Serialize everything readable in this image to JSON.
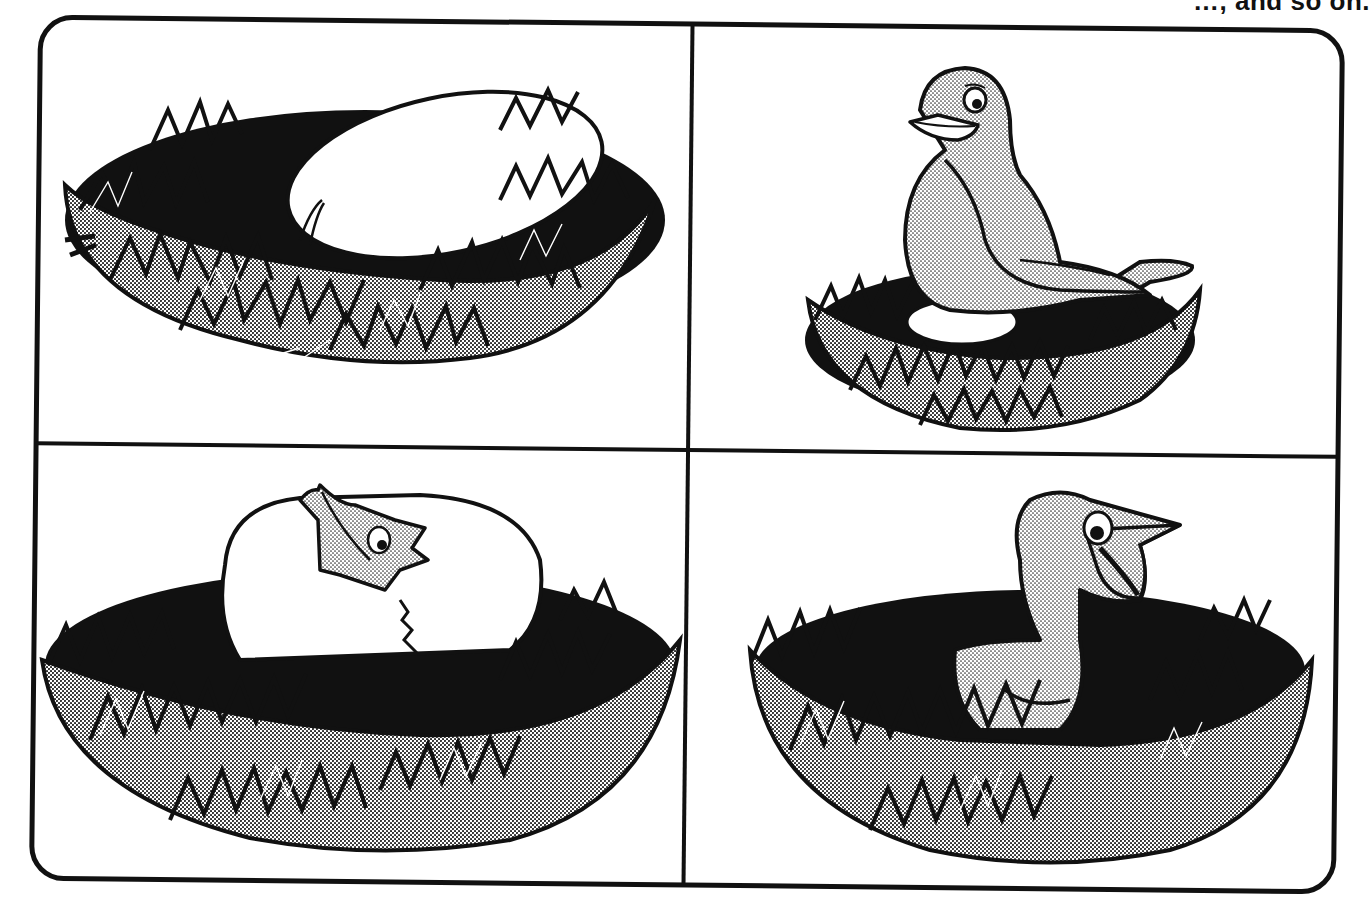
{
  "page": {
    "top_caption_fragment": "…, and so on.",
    "background": "#ffffff",
    "ink": "#111111",
    "shade": "#a8a8a8"
  },
  "panels": [
    {
      "id": "panel-1",
      "position": "top-left",
      "subject": "egg in nest",
      "description": "A single white egg resting in a grassy nest"
    },
    {
      "id": "panel-2",
      "position": "top-right",
      "subject": "bird sitting on nest",
      "description": "A mother bird sitting on the egg in the nest"
    },
    {
      "id": "panel-3",
      "position": "bottom-left",
      "subject": "chick hatching",
      "description": "A baby bird breaking out of the egg in the nest"
    },
    {
      "id": "panel-4",
      "position": "bottom-right",
      "subject": "hatched chick in nest",
      "description": "A young bird standing in the nest, smiling"
    }
  ]
}
